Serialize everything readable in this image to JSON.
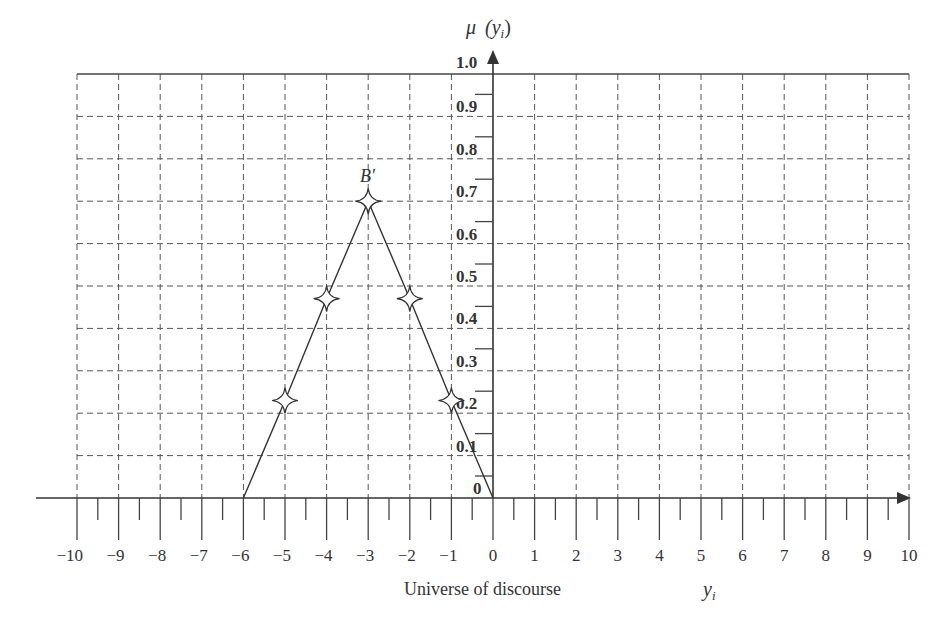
{
  "chart_data": {
    "type": "line",
    "title": "",
    "xlabel": "Universe of discourse",
    "xvar": "y_i",
    "ylabel": "μ (y_i)",
    "xlim": [
      -10,
      10
    ],
    "ylim": [
      0,
      1.0
    ],
    "grid": true,
    "x_ticks": [
      -10,
      -9,
      -8,
      -7,
      -6,
      -5,
      -4,
      -3,
      -2,
      -1,
      0,
      1,
      2,
      3,
      4,
      5,
      6,
      7,
      8,
      9,
      10
    ],
    "x_tick_labels": [
      "−10",
      "−9",
      "−8",
      "−7",
      "−6",
      "−5",
      "−4",
      "−3",
      "−2",
      "−1",
      "0",
      "1",
      "2",
      "3",
      "4",
      "5",
      "6",
      "7",
      "8",
      "9",
      "10"
    ],
    "y_ticks": [
      0,
      0.1,
      0.2,
      0.3,
      0.4,
      0.5,
      0.6,
      0.7,
      0.8,
      0.9,
      1.0
    ],
    "y_tick_labels": [
      "0",
      "0.1",
      "0.2",
      "0.3",
      "0.4",
      "0.5",
      "0.6",
      "0.7",
      "0.8",
      "0.9",
      "1.0"
    ],
    "series": [
      {
        "name": "B′",
        "x": [
          -6,
          -5,
          -4,
          -3,
          -2,
          -1,
          0
        ],
        "y": [
          0,
          0.23,
          0.47,
          0.7,
          0.47,
          0.23,
          0
        ],
        "markers_at": [
          -5,
          -4,
          -3,
          -2,
          -1
        ],
        "marker": "four-point-star"
      }
    ],
    "annotations": [
      {
        "text": "B′",
        "x": -3,
        "y": 0.7,
        "position": "above"
      }
    ]
  },
  "labels": {
    "y_axis": "μ",
    "y_axis_arg": "(y",
    "y_axis_sub": "i",
    "y_axis_close": ")",
    "x_caption": "Universe of discourse",
    "x_var": "y",
    "x_var_sub": "i",
    "series_label": "B′"
  }
}
